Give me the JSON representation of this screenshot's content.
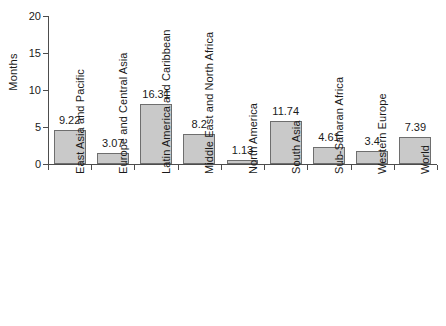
{
  "chart_data": {
    "type": "bar",
    "title": "",
    "xlabel": "",
    "ylabel": "Months",
    "ylim": [
      0,
      20
    ],
    "yticks": [
      0,
      5,
      10,
      15,
      20
    ],
    "grid": false,
    "legend": false,
    "note": "Bar heights are drawn at half the printed data-label value; printed labels are the reported values.",
    "categories": [
      "East Asia and Pacific",
      "Europe and Central Asia",
      "Latin America and Caribbean",
      "Middle East and North Africa",
      "North America",
      "South Asia",
      "Sub-Saharan Africa",
      "Western Europe",
      "World"
    ],
    "values": [
      9.22,
      3.07,
      16.31,
      8.2,
      1.13,
      11.74,
      4.61,
      3.4,
      7.39
    ],
    "value_labels": [
      "9.22",
      "3.07",
      "16.31",
      "8.2",
      "1.13",
      "11.74",
      "4.61",
      "3.4",
      "7.39"
    ],
    "plotted_heights": [
      4.61,
      1.535,
      8.155,
      4.1,
      0.565,
      5.87,
      2.305,
      1.7,
      3.695
    ],
    "colors": {
      "bar_fill": "#c9c9c9",
      "bar_border": "#6e6e6e",
      "axis": "#4d4d4d",
      "text": "#1a1a1a",
      "background": "#ffffff"
    }
  },
  "axis": {
    "y_tick_labels": [
      "0",
      "5",
      "10",
      "15",
      "20"
    ],
    "y_title": "Months"
  }
}
